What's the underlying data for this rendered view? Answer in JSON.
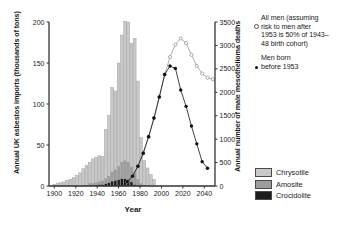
{
  "chart_data": {
    "type": "bar",
    "title": "",
    "xlabel": "Year",
    "ylabel_left": "Annual UK asbestos imports (thousands of tons)",
    "ylabel_right": "Annual number of male mesothelioma deaths",
    "xlim": [
      1895,
      2050
    ],
    "xticks": [
      1900,
      1920,
      1940,
      1960,
      1980,
      2000,
      2020,
      2040
    ],
    "ylim_left": [
      0,
      200
    ],
    "yticks_left": [
      0,
      50,
      100,
      150,
      200
    ],
    "ylim_right": [
      0,
      3500
    ],
    "yticks_right": [
      0,
      500,
      1000,
      1500,
      2000,
      2500,
      3000,
      3500
    ],
    "grid": false,
    "legend_position": "right-top and right-bottom",
    "bar_series": [
      {
        "name": "Chrysotile",
        "color": "#c9c9c9",
        "x": [
          1900,
          1903,
          1906,
          1909,
          1912,
          1915,
          1918,
          1921,
          1924,
          1927,
          1930,
          1933,
          1936,
          1939,
          1942,
          1945,
          1948,
          1951,
          1954,
          1957,
          1960,
          1963,
          1966,
          1969,
          1972,
          1975,
          1978,
          1981,
          1984,
          1987,
          1990,
          1993
        ],
        "values": [
          2,
          3,
          4,
          5,
          7,
          8,
          10,
          13,
          16,
          20,
          24,
          26,
          30,
          31,
          32,
          30,
          60,
          74,
          103,
          96,
          126,
          155,
          170,
          171,
          151,
          164,
          120,
          56,
          30,
          22,
          14,
          8
        ]
      },
      {
        "name": "Amosite",
        "color": "#9d9d9d",
        "x": [
          1900,
          1903,
          1906,
          1909,
          1912,
          1915,
          1918,
          1921,
          1924,
          1927,
          1930,
          1933,
          1936,
          1939,
          1942,
          1945,
          1948,
          1951,
          1954,
          1957,
          1960,
          1963,
          1966,
          1969,
          1972,
          1975,
          1978,
          1981,
          1984,
          1987,
          1990,
          1993
        ],
        "values": [
          0,
          0,
          0,
          0,
          0,
          0,
          0,
          0,
          0,
          1,
          1,
          2,
          2,
          3,
          3,
          4,
          6,
          8,
          11,
          13,
          16,
          20,
          22,
          21,
          18,
          14,
          7,
          3,
          1,
          0,
          0,
          0
        ]
      },
      {
        "name": "Crocidolite",
        "color": "#1c1c1c",
        "x": [
          1900,
          1903,
          1906,
          1909,
          1912,
          1915,
          1918,
          1921,
          1924,
          1927,
          1930,
          1933,
          1936,
          1939,
          1942,
          1945,
          1948,
          1951,
          1954,
          1957,
          1960,
          1963,
          1966,
          1969,
          1972,
          1975,
          1978,
          1981,
          1984,
          1987,
          1990,
          1993
        ],
        "values": [
          0,
          0,
          0,
          0,
          0,
          0,
          0,
          0,
          0,
          0,
          0,
          1,
          1,
          1,
          2,
          2,
          3,
          4,
          6,
          7,
          8,
          9,
          9,
          8,
          5,
          2,
          1,
          0,
          0,
          0,
          0,
          0
        ]
      }
    ],
    "line_series": [
      {
        "name": "All men (assuming risk to men after 1953 is 50% of 1943-48 birth cohort)",
        "marker": "open-circle",
        "color": "#999999",
        "x": [
          1968,
          1973,
          1978,
          1983,
          1988,
          1993,
          1998,
          2003,
          2008,
          2013,
          2018,
          2023,
          2028,
          2033,
          2038,
          2043,
          2048
        ],
        "values": [
          90,
          210,
          420,
          700,
          1050,
          1450,
          1900,
          2380,
          2750,
          3020,
          3150,
          3050,
          2800,
          2560,
          2400,
          2310,
          2280
        ]
      },
      {
        "name": "Men born before 1953",
        "marker": "filled-dot",
        "color": "#111111",
        "x": [
          1968,
          1973,
          1978,
          1983,
          1988,
          1993,
          1998,
          2003,
          2008,
          2013,
          2018,
          2023,
          2028,
          2033,
          2038,
          2043
        ],
        "values": [
          90,
          210,
          420,
          700,
          1050,
          1450,
          1900,
          2380,
          2560,
          2510,
          2050,
          1700,
          1280,
          900,
          520,
          380
        ]
      }
    ]
  },
  "legend_right": {
    "items": [
      {
        "marker": "open-circle-marker",
        "lines": [
          "All men (assuming",
          "risk to men after",
          "1953 is 50% of 1943–",
          "48 birth cohort)"
        ]
      },
      {
        "marker": "filled-dot-marker",
        "lines": [
          "Men born",
          "before 1953"
        ]
      }
    ]
  },
  "legend_bottom": {
    "items": [
      {
        "label": "Chrysotile",
        "color": "#c9c9c9"
      },
      {
        "label": "Amosite",
        "color": "#9d9d9d"
      },
      {
        "label": "Crocidolite",
        "color": "#1c1c1c"
      }
    ]
  }
}
